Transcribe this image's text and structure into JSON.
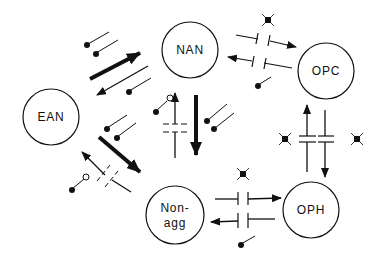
{
  "diagram": {
    "type": "state-transition-network",
    "colors": {
      "stroke": "#111111",
      "background": "#ffffff"
    },
    "nodes": [
      {
        "id": "NAN",
        "label": "NAN"
      },
      {
        "id": "OPC",
        "label": "OPC"
      },
      {
        "id": "EAN",
        "label": "EAN"
      },
      {
        "id": "OPH",
        "label": "OPH"
      },
      {
        "id": "NONAGG",
        "label_line1": "Non-",
        "label_line2": "agg"
      }
    ],
    "edges": [
      {
        "from": "EAN",
        "to": "NAN",
        "style": "bold"
      },
      {
        "from": "NAN",
        "to": "EAN",
        "style": "normal"
      },
      {
        "from": "NAN",
        "to": "OPC",
        "style": "normal",
        "blocked": true
      },
      {
        "from": "OPC",
        "to": "NAN",
        "style": "normal",
        "blocked": true
      },
      {
        "from": "NAN",
        "to": "NONAGG",
        "style": "bold"
      },
      {
        "from": "NONAGG",
        "to": "NAN",
        "style": "normal",
        "blocked": true
      },
      {
        "from": "EAN",
        "to": "NONAGG",
        "style": "bold"
      },
      {
        "from": "NONAGG",
        "to": "EAN",
        "style": "normal",
        "blocked": true
      },
      {
        "from": "OPH",
        "to": "OPC",
        "style": "normal",
        "blocked": true
      },
      {
        "from": "OPC",
        "to": "OPH",
        "style": "normal",
        "blocked": true
      },
      {
        "from": "NONAGG",
        "to": "OPH",
        "style": "normal",
        "blocked": true
      },
      {
        "from": "OPH",
        "to": "NONAGG",
        "style": "normal",
        "blocked": true
      }
    ],
    "legend_symbols": [
      "filled-pin",
      "open-pin",
      "x-marker",
      "block-gap"
    ]
  }
}
